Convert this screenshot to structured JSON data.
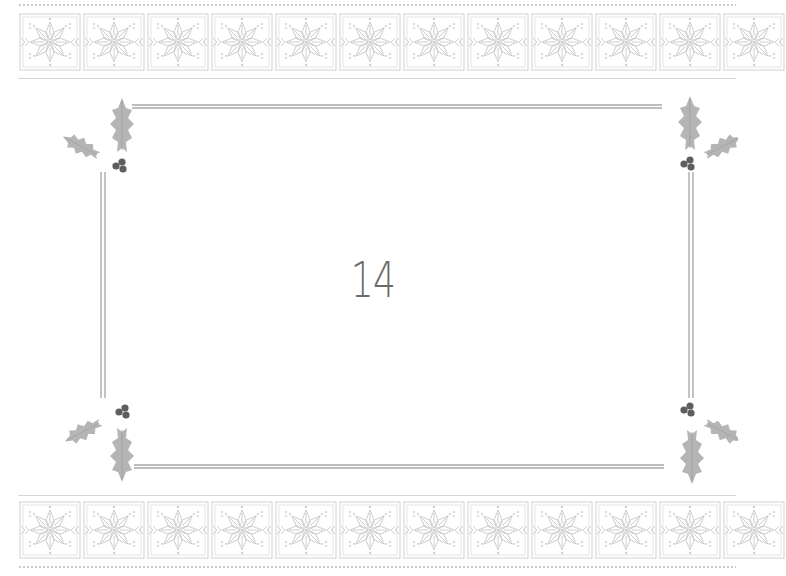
{
  "card": {
    "number": "14",
    "theme": "holly-christmas-frame"
  },
  "colors": {
    "background": "#ffffff",
    "pattern": "#cfcfcf",
    "frame_lines": "#bdbdbd",
    "holly_leaf": "#b5b5b5",
    "berry": "#5e5e5e",
    "number_text": "#6b6b6b"
  },
  "decor": {
    "top_band": {
      "motif": "snowflake-tile",
      "tile_count": 12
    },
    "bottom_band": {
      "motif": "snowflake-tile",
      "tile_count": 12
    },
    "corners": [
      "holly-top-left",
      "holly-top-right",
      "holly-bottom-left",
      "holly-bottom-right"
    ]
  }
}
